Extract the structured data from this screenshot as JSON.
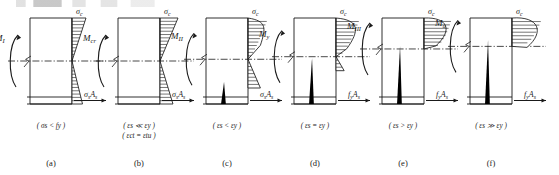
{
  "figure": {
    "title_fragment": "",
    "panel_count": 6,
    "ink_color": "#1a1a1a",
    "crack_color": "#000000",
    "background": "#ffffff"
  },
  "stress_symbol_top": "σc",
  "panels": [
    {
      "key": "a",
      "caption": "(a)",
      "moment_label": "M₁",
      "moment_sub": "I",
      "top_stress_label": "σc",
      "force_label": "σsAs",
      "force_kind": "sigma",
      "conditions": [
        "( σs < fy )"
      ],
      "stage_name": "uncracked-elastic",
      "compression_shape": "linear",
      "tension_shape": "linear",
      "crack_height": 0,
      "neutral_axis_frac": 0.5,
      "compression_depth_px": 14
    },
    {
      "key": "b",
      "caption": "(b)",
      "moment_label": "Mcr",
      "moment_sub": "cr",
      "top_stress_label": "σc",
      "force_label": "σsAs",
      "force_kind": "sigma",
      "conditions": [
        "( εs ≪ εy )",
        "( εct = εtu )"
      ],
      "stage_name": "cracking-imminent",
      "compression_shape": "linear",
      "tension_shape": "linear-full",
      "crack_height": 0,
      "neutral_axis_frac": 0.5,
      "compression_depth_px": 18
    },
    {
      "key": "c",
      "caption": "(c)",
      "moment_label": "M₁₁",
      "moment_sub": "II",
      "top_stress_label": "σc",
      "force_label": "σsAs",
      "force_kind": "sigma",
      "conditions": [
        "( εs < εy )"
      ],
      "stage_name": "cracked-elastic",
      "compression_shape": "slightly-curved",
      "tension_shape": "linear-residual",
      "crack_height": 22,
      "neutral_axis_frac": 0.48,
      "compression_depth_px": 20
    },
    {
      "key": "d",
      "caption": "(d)",
      "moment_label": "My",
      "moment_sub": "y",
      "top_stress_label": "σc",
      "force_label": "fyAs",
      "force_kind": "fy",
      "conditions": [
        "( εs = εy )"
      ],
      "stage_name": "steel-yielding",
      "compression_shape": "curved",
      "tension_shape": "small-residual",
      "crack_height": 46,
      "neutral_axis_frac": 0.45,
      "compression_depth_px": 24
    },
    {
      "key": "e",
      "caption": "(e)",
      "moment_label": "M₁₁₁",
      "moment_sub": "III",
      "top_stress_label": "σc",
      "force_label": "fyAs",
      "force_kind": "fy",
      "conditions": [
        "( εs > εy )"
      ],
      "stage_name": "post-yield",
      "compression_shape": "parabolic",
      "tension_shape": "none",
      "crack_height": 58,
      "neutral_axis_frac": 0.36,
      "compression_depth_px": 28
    },
    {
      "key": "f",
      "caption": "(f)",
      "moment_label": "Mu",
      "moment_sub": "u",
      "top_stress_label": "σc",
      "force_label": "fyAs",
      "force_kind": "fy",
      "conditions": [
        "( εs ≫ εy )"
      ],
      "stage_name": "ultimate",
      "compression_shape": "full-parabolic",
      "tension_shape": "none",
      "crack_height": 64,
      "neutral_axis_frac": 0.33,
      "compression_depth_px": 30
    }
  ],
  "symbols": {
    "sigma_c": "σc",
    "sigma_s_as": "σsAs",
    "fy_as": "fyAs",
    "epsilon_s": "εs",
    "epsilon_y": "εy",
    "epsilon_ct": "εct",
    "epsilon_tu": "εtu",
    "f_y": "fy"
  }
}
